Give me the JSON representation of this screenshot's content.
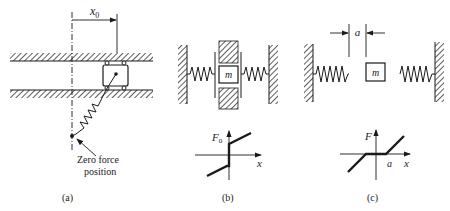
{
  "figure": {
    "panels": [
      {
        "id": "a",
        "caption": "(a)",
        "dimension_label": "x",
        "dimension_subscript": "0",
        "annotation": [
          "Zero force",
          "position"
        ]
      },
      {
        "id": "b",
        "caption": "(b)",
        "mass_label": "m",
        "graph": {
          "y_label": "F",
          "y_subscript": "0",
          "x_label": "x"
        }
      },
      {
        "id": "c",
        "caption": "(c)",
        "gap_label": "a",
        "mass_label": "m",
        "graph": {
          "y_label": "F",
          "x_label": "x",
          "x_tick": "a"
        }
      }
    ]
  },
  "colors": {
    "ink": "#1a1a1a",
    "background": "#ffffff"
  }
}
